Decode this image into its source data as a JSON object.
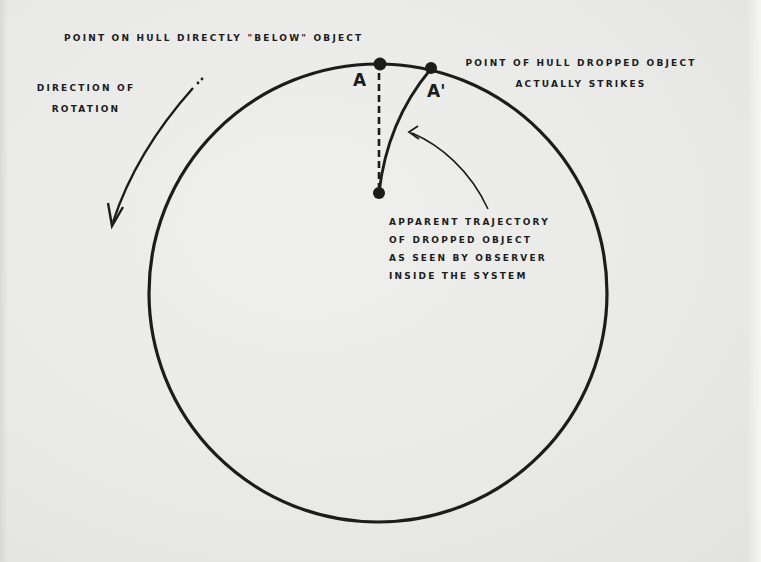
{
  "diagram": {
    "labels": {
      "point_below": "POINT ON HULL DIRECTLY \"BELOW\" OBJECT",
      "point_strikes_line1": "POINT OF HULL DROPPED OBJECT",
      "point_strikes_line2": "ACTUALLY STRIKES",
      "direction_line1": "DIRECTION OF",
      "direction_line2": "ROTATION",
      "trajectory_line1": "APPARENT TRAJECTORY",
      "trajectory_line2": "OF DROPPED OBJECT",
      "trajectory_line3": "AS SEEN BY OBSERVER",
      "trajectory_line4": "INSIDE THE SYSTEM"
    },
    "points": {
      "a": "A",
      "a_prime": "A'"
    },
    "elements": {
      "hull_circle": "circle representing rotating hull",
      "drop_start": "dropped object release point",
      "vertical_path": "dashed line straight down to A",
      "curved_path": "curved apparent trajectory to A'",
      "rotation_arrow": "counter-clockwise rotation arrow",
      "trajectory_pointer": "arrow pointing at curved trajectory"
    },
    "colors": {
      "ink": "#1c1c1c",
      "paper": "#ebebea"
    }
  }
}
